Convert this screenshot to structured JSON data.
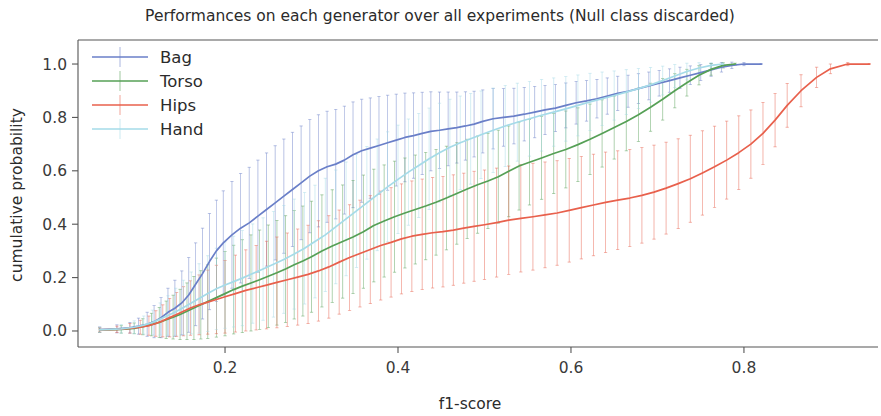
{
  "chart_data": {
    "type": "line",
    "title": "Performances on each generator over all experiments (Null class discarded)",
    "xlabel": "f1-score",
    "ylabel": "cumulative probability",
    "xlim": [
      0.03,
      0.955
    ],
    "ylim": [
      -0.06,
      1.09
    ],
    "xticks": [
      0.2,
      0.4,
      0.6,
      0.8
    ],
    "xticklabels": [
      "0.2",
      "0.4",
      "0.6",
      "0.8"
    ],
    "yticks": [
      0.0,
      0.2,
      0.4,
      0.6,
      0.8,
      1.0
    ],
    "yticklabels": [
      "0.0",
      "0.2",
      "0.4",
      "0.6",
      "0.8",
      "1.0"
    ],
    "grid": false,
    "legend_position": "upper left",
    "legend_entries": [
      "Bag",
      "Torso",
      "Hips",
      "Hand"
    ],
    "colors": {
      "Bag": "#6a7fc8",
      "Torso": "#56a056",
      "Hips": "#e8604c",
      "Hand": "#a5dbe8"
    },
    "series": [
      {
        "name": "Bag",
        "color": "#6a7fc8",
        "x": [
          0.055,
          0.075,
          0.09,
          0.1,
          0.11,
          0.118,
          0.126,
          0.134,
          0.142,
          0.15,
          0.158,
          0.166,
          0.174,
          0.182,
          0.19,
          0.198,
          0.208,
          0.218,
          0.228,
          0.238,
          0.248,
          0.258,
          0.268,
          0.278,
          0.288,
          0.298,
          0.308,
          0.318,
          0.328,
          0.338,
          0.348,
          0.358,
          0.368,
          0.378,
          0.388,
          0.398,
          0.408,
          0.418,
          0.428,
          0.438,
          0.448,
          0.458,
          0.468,
          0.478,
          0.488,
          0.498,
          0.51,
          0.522,
          0.534,
          0.546,
          0.558,
          0.57,
          0.582,
          0.594,
          0.606,
          0.618,
          0.63,
          0.642,
          0.654,
          0.666,
          0.678,
          0.69,
          0.702,
          0.714,
          0.726,
          0.738,
          0.75,
          0.762,
          0.774,
          0.786,
          0.8,
          0.82
        ],
        "y": [
          0.005,
          0.008,
          0.012,
          0.018,
          0.025,
          0.035,
          0.05,
          0.07,
          0.085,
          0.105,
          0.135,
          0.175,
          0.215,
          0.26,
          0.3,
          0.33,
          0.36,
          0.385,
          0.405,
          0.43,
          0.455,
          0.48,
          0.505,
          0.53,
          0.555,
          0.58,
          0.6,
          0.615,
          0.625,
          0.64,
          0.66,
          0.675,
          0.685,
          0.695,
          0.705,
          0.715,
          0.725,
          0.732,
          0.74,
          0.748,
          0.752,
          0.757,
          0.762,
          0.768,
          0.775,
          0.785,
          0.795,
          0.8,
          0.805,
          0.812,
          0.82,
          0.828,
          0.835,
          0.845,
          0.855,
          0.862,
          0.87,
          0.88,
          0.89,
          0.898,
          0.908,
          0.918,
          0.928,
          0.938,
          0.948,
          0.958,
          0.968,
          0.978,
          0.988,
          0.995,
          1.0,
          1.0
        ],
        "yerr": [
          0.01,
          0.015,
          0.02,
          0.03,
          0.045,
          0.06,
          0.075,
          0.09,
          0.105,
          0.12,
          0.14,
          0.155,
          0.17,
          0.18,
          0.19,
          0.195,
          0.2,
          0.205,
          0.208,
          0.21,
          0.212,
          0.214,
          0.214,
          0.214,
          0.213,
          0.212,
          0.21,
          0.208,
          0.205,
          0.202,
          0.198,
          0.193,
          0.188,
          0.183,
          0.178,
          0.172,
          0.166,
          0.16,
          0.154,
          0.148,
          0.143,
          0.138,
          0.133,
          0.128,
          0.123,
          0.118,
          0.113,
          0.108,
          0.104,
          0.1,
          0.096,
          0.092,
          0.088,
          0.084,
          0.08,
          0.076,
          0.072,
          0.068,
          0.064,
          0.06,
          0.056,
          0.052,
          0.048,
          0.044,
          0.04,
          0.035,
          0.03,
          0.024,
          0.018,
          0.012,
          0.006,
          0.002
        ]
      },
      {
        "name": "Torso",
        "color": "#56a056",
        "x": [
          0.055,
          0.08,
          0.095,
          0.105,
          0.115,
          0.124,
          0.132,
          0.14,
          0.148,
          0.156,
          0.164,
          0.172,
          0.18,
          0.19,
          0.2,
          0.21,
          0.22,
          0.23,
          0.24,
          0.25,
          0.26,
          0.27,
          0.28,
          0.29,
          0.3,
          0.312,
          0.324,
          0.336,
          0.348,
          0.36,
          0.372,
          0.384,
          0.396,
          0.408,
          0.42,
          0.432,
          0.444,
          0.456,
          0.468,
          0.48,
          0.492,
          0.504,
          0.516,
          0.528,
          0.54,
          0.552,
          0.566,
          0.58,
          0.594,
          0.608,
          0.622,
          0.636,
          0.65,
          0.664,
          0.678,
          0.692,
          0.706,
          0.72,
          0.734,
          0.748,
          0.762,
          0.776,
          0.79
        ],
        "y": [
          0.003,
          0.006,
          0.01,
          0.016,
          0.024,
          0.032,
          0.042,
          0.052,
          0.062,
          0.074,
          0.086,
          0.098,
          0.11,
          0.125,
          0.14,
          0.155,
          0.168,
          0.18,
          0.192,
          0.205,
          0.218,
          0.232,
          0.248,
          0.262,
          0.278,
          0.3,
          0.318,
          0.335,
          0.352,
          0.372,
          0.395,
          0.412,
          0.428,
          0.442,
          0.455,
          0.468,
          0.482,
          0.498,
          0.515,
          0.532,
          0.548,
          0.562,
          0.578,
          0.598,
          0.618,
          0.632,
          0.648,
          0.665,
          0.68,
          0.698,
          0.718,
          0.74,
          0.762,
          0.785,
          0.81,
          0.838,
          0.868,
          0.9,
          0.93,
          0.958,
          0.98,
          0.995,
          1.0
        ],
        "yerr": [
          0.008,
          0.014,
          0.02,
          0.03,
          0.042,
          0.056,
          0.07,
          0.082,
          0.094,
          0.106,
          0.118,
          0.128,
          0.138,
          0.148,
          0.158,
          0.166,
          0.174,
          0.18,
          0.186,
          0.192,
          0.196,
          0.2,
          0.203,
          0.206,
          0.208,
          0.21,
          0.211,
          0.212,
          0.212,
          0.212,
          0.211,
          0.21,
          0.208,
          0.206,
          0.204,
          0.201,
          0.198,
          0.194,
          0.19,
          0.186,
          0.182,
          0.178,
          0.174,
          0.17,
          0.165,
          0.16,
          0.155,
          0.15,
          0.144,
          0.138,
          0.132,
          0.126,
          0.118,
          0.11,
          0.1,
          0.09,
          0.078,
          0.064,
          0.05,
          0.036,
          0.022,
          0.01,
          0.003
        ]
      },
      {
        "name": "Hips",
        "color": "#e8604c",
        "x": [
          0.055,
          0.075,
          0.09,
          0.102,
          0.112,
          0.12,
          0.128,
          0.136,
          0.144,
          0.152,
          0.16,
          0.17,
          0.18,
          0.19,
          0.2,
          0.212,
          0.224,
          0.236,
          0.248,
          0.26,
          0.272,
          0.284,
          0.296,
          0.308,
          0.32,
          0.332,
          0.344,
          0.356,
          0.368,
          0.38,
          0.392,
          0.404,
          0.416,
          0.428,
          0.44,
          0.452,
          0.464,
          0.476,
          0.488,
          0.5,
          0.514,
          0.528,
          0.542,
          0.556,
          0.57,
          0.584,
          0.598,
          0.612,
          0.626,
          0.64,
          0.654,
          0.668,
          0.682,
          0.696,
          0.71,
          0.724,
          0.738,
          0.752,
          0.766,
          0.78,
          0.794,
          0.808,
          0.822,
          0.836,
          0.85,
          0.866,
          0.884,
          0.9,
          0.92,
          0.945
        ],
        "y": [
          0.004,
          0.006,
          0.01,
          0.014,
          0.02,
          0.028,
          0.038,
          0.05,
          0.062,
          0.074,
          0.086,
          0.098,
          0.108,
          0.118,
          0.128,
          0.14,
          0.152,
          0.162,
          0.172,
          0.182,
          0.192,
          0.202,
          0.212,
          0.225,
          0.24,
          0.258,
          0.275,
          0.29,
          0.305,
          0.32,
          0.332,
          0.345,
          0.355,
          0.362,
          0.368,
          0.372,
          0.378,
          0.385,
          0.392,
          0.398,
          0.406,
          0.415,
          0.422,
          0.428,
          0.435,
          0.442,
          0.452,
          0.462,
          0.472,
          0.482,
          0.49,
          0.498,
          0.508,
          0.52,
          0.535,
          0.552,
          0.57,
          0.592,
          0.615,
          0.64,
          0.668,
          0.7,
          0.74,
          0.79,
          0.845,
          0.9,
          0.95,
          0.982,
          1.0,
          1.0
        ],
        "yerr": [
          0.008,
          0.012,
          0.018,
          0.026,
          0.036,
          0.048,
          0.06,
          0.072,
          0.082,
          0.092,
          0.102,
          0.112,
          0.12,
          0.128,
          0.136,
          0.144,
          0.152,
          0.158,
          0.164,
          0.17,
          0.175,
          0.18,
          0.184,
          0.188,
          0.192,
          0.195,
          0.198,
          0.2,
          0.202,
          0.204,
          0.205,
          0.206,
          0.207,
          0.207,
          0.207,
          0.207,
          0.207,
          0.206,
          0.206,
          0.205,
          0.204,
          0.203,
          0.201,
          0.2,
          0.198,
          0.196,
          0.194,
          0.192,
          0.19,
          0.188,
          0.185,
          0.182,
          0.179,
          0.176,
          0.172,
          0.168,
          0.163,
          0.158,
          0.152,
          0.146,
          0.138,
          0.128,
          0.116,
          0.1,
          0.082,
          0.06,
          0.038,
          0.018,
          0.006,
          0.002
        ]
      },
      {
        "name": "Hand",
        "color": "#a5dbe8",
        "x": [
          0.055,
          0.08,
          0.095,
          0.106,
          0.116,
          0.125,
          0.134,
          0.143,
          0.152,
          0.161,
          0.17,
          0.18,
          0.19,
          0.2,
          0.21,
          0.22,
          0.232,
          0.244,
          0.256,
          0.268,
          0.28,
          0.292,
          0.304,
          0.316,
          0.328,
          0.34,
          0.352,
          0.364,
          0.376,
          0.388,
          0.4,
          0.412,
          0.424,
          0.436,
          0.448,
          0.46,
          0.472,
          0.484,
          0.496,
          0.51,
          0.524,
          0.538,
          0.552,
          0.566,
          0.58,
          0.594,
          0.608,
          0.622,
          0.636,
          0.65,
          0.664,
          0.678,
          0.692,
          0.706,
          0.72,
          0.734,
          0.748,
          0.762,
          0.776
        ],
        "y": [
          0.004,
          0.008,
          0.014,
          0.022,
          0.032,
          0.045,
          0.058,
          0.072,
          0.088,
          0.105,
          0.122,
          0.14,
          0.158,
          0.172,
          0.185,
          0.198,
          0.215,
          0.232,
          0.25,
          0.268,
          0.288,
          0.31,
          0.335,
          0.36,
          0.39,
          0.42,
          0.45,
          0.48,
          0.51,
          0.54,
          0.568,
          0.595,
          0.62,
          0.645,
          0.668,
          0.688,
          0.705,
          0.72,
          0.735,
          0.752,
          0.768,
          0.782,
          0.795,
          0.808,
          0.82,
          0.832,
          0.845,
          0.858,
          0.87,
          0.882,
          0.895,
          0.908,
          0.922,
          0.938,
          0.955,
          0.972,
          0.985,
          0.995,
          1.0
        ],
        "yerr": [
          0.01,
          0.016,
          0.024,
          0.034,
          0.046,
          0.06,
          0.074,
          0.088,
          0.102,
          0.116,
          0.13,
          0.142,
          0.152,
          0.162,
          0.17,
          0.178,
          0.186,
          0.192,
          0.198,
          0.202,
          0.206,
          0.209,
          0.211,
          0.212,
          0.213,
          0.213,
          0.212,
          0.211,
          0.209,
          0.206,
          0.203,
          0.199,
          0.195,
          0.19,
          0.185,
          0.18,
          0.175,
          0.17,
          0.164,
          0.158,
          0.152,
          0.146,
          0.14,
          0.134,
          0.128,
          0.121,
          0.114,
          0.107,
          0.1,
          0.092,
          0.084,
          0.075,
          0.065,
          0.054,
          0.043,
          0.031,
          0.02,
          0.01,
          0.003
        ]
      }
    ]
  },
  "figure": {
    "background": "#ffffff",
    "axis_color": "#555555"
  }
}
